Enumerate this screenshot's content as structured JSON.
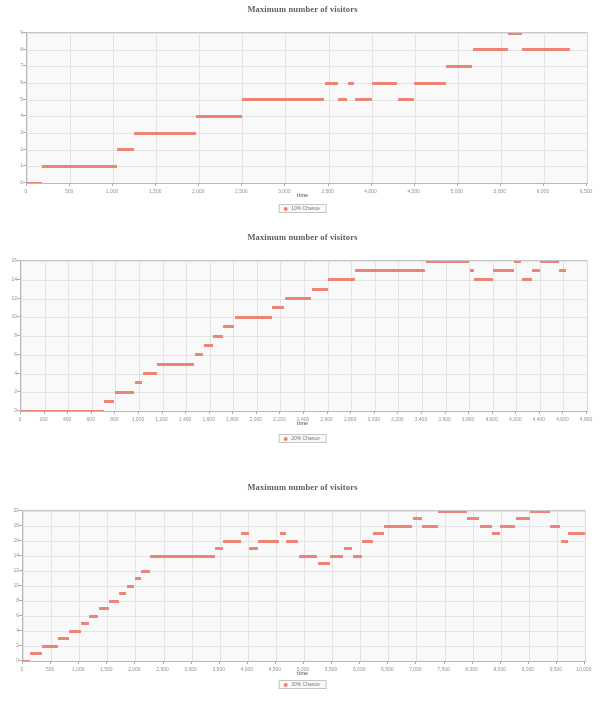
{
  "document": {
    "kind": "scanned-figure-page",
    "figure_count": 3
  },
  "accent_color": "#f0806e",
  "charts": [
    {
      "id": "chart-10-percent",
      "title": "Maximum number of visitors",
      "xlabel": "time",
      "ylabel": "",
      "legend": "10% Chance",
      "legend_position": "bottom-center"
    },
    {
      "id": "chart-20-percent",
      "title": "Maximum number of visitors",
      "xlabel": "time",
      "ylabel": "",
      "legend": "20% Chance",
      "legend_position": "bottom-center"
    },
    {
      "id": "chart-30-percent",
      "title": "Maximum number of visitors",
      "xlabel": "time",
      "ylabel": "",
      "legend": "30% Chance",
      "legend_position": "bottom-center"
    }
  ],
  "chart_data": [
    {
      "type": "scatter",
      "title": "Maximum number of visitors",
      "xlabel": "time",
      "ylabel": "",
      "legend": [
        "10% Chance"
      ],
      "legend_position": "bottom-center",
      "grid": true,
      "xlim": [
        0,
        6500
      ],
      "ylim": [
        0,
        9
      ],
      "xticks": [
        0,
        500,
        1000,
        1500,
        2000,
        2500,
        3000,
        3500,
        4000,
        4500,
        5000,
        5500,
        6000,
        6500
      ],
      "xtick_labels": [
        "0",
        "500",
        "1,000",
        "1,500",
        "2,000",
        "2,500",
        "3,000",
        "3,500",
        "4,000",
        "4,500",
        "5,000",
        "5,500",
        "6,000",
        "6,500"
      ],
      "yticks": [
        0,
        1,
        2,
        3,
        4,
        5,
        6,
        7,
        8,
        9
      ],
      "ytick_labels": [
        "0",
        "1",
        "2",
        "3",
        "4",
        "5",
        "6",
        "7",
        "8",
        "9"
      ],
      "series": [
        {
          "name": "10% Chance",
          "color": "#f0806e",
          "segments": [
            {
              "x0": 0,
              "x1": 170,
              "y": 0
            },
            {
              "x0": 175,
              "x1": 1040,
              "y": 1
            },
            {
              "x0": 1045,
              "x1": 1240,
              "y": 2
            },
            {
              "x0": 1245,
              "x1": 1960,
              "y": 3
            },
            {
              "x0": 1965,
              "x1": 2490,
              "y": 4
            },
            {
              "x0": 2495,
              "x1": 3450,
              "y": 5
            },
            {
              "x0": 3455,
              "x1": 3610,
              "y": 6
            },
            {
              "x0": 3615,
              "x1": 3720,
              "y": 5
            },
            {
              "x0": 3725,
              "x1": 3800,
              "y": 6
            },
            {
              "x0": 3805,
              "x1": 4000,
              "y": 5
            },
            {
              "x0": 4005,
              "x1": 4300,
              "y": 6
            },
            {
              "x0": 4305,
              "x1": 4490,
              "y": 5
            },
            {
              "x0": 4495,
              "x1": 4860,
              "y": 6
            },
            {
              "x0": 4865,
              "x1": 5170,
              "y": 7
            },
            {
              "x0": 5175,
              "x1": 5580,
              "y": 8
            },
            {
              "x0": 5585,
              "x1": 5740,
              "y": 9
            },
            {
              "x0": 5745,
              "x1": 6300,
              "y": 8
            }
          ]
        }
      ]
    },
    {
      "type": "scatter",
      "title": "Maximum number of visitors",
      "xlabel": "time",
      "ylabel": "",
      "legend": [
        "20% Chance"
      ],
      "legend_position": "bottom-center",
      "grid": true,
      "xlim": [
        0,
        4800
      ],
      "ylim": [
        0,
        16
      ],
      "xticks": [
        0,
        200,
        400,
        600,
        800,
        1000,
        1200,
        1400,
        1600,
        1800,
        2000,
        2200,
        2400,
        2600,
        2800,
        3000,
        3200,
        3400,
        3600,
        3800,
        4000,
        4200,
        4400,
        4600,
        4800
      ],
      "xtick_labels": [
        "0",
        "200",
        "400",
        "600",
        "800",
        "1,000",
        "1,200",
        "1,400",
        "1,600",
        "1,800",
        "2,000",
        "2,200",
        "2,400",
        "2,600",
        "2,800",
        "3,000",
        "3,200",
        "3,400",
        "3,600",
        "3,800",
        "4,000",
        "4,200",
        "4,400",
        "4,600",
        "4,800"
      ],
      "yticks": [
        0,
        2,
        4,
        6,
        8,
        10,
        12,
        14,
        16
      ],
      "ytick_labels": [
        "0",
        "2",
        "4",
        "6",
        "8",
        "10",
        "12",
        "14",
        "16"
      ],
      "series": [
        {
          "name": "20% Chance",
          "color": "#f0806e",
          "segments": [
            {
              "x0": 0,
              "x1": 700,
              "y": 0
            },
            {
              "x0": 705,
              "x1": 790,
              "y": 1
            },
            {
              "x0": 795,
              "x1": 960,
              "y": 2
            },
            {
              "x0": 965,
              "x1": 1030,
              "y": 3
            },
            {
              "x0": 1035,
              "x1": 1150,
              "y": 4
            },
            {
              "x0": 1155,
              "x1": 1470,
              "y": 5
            },
            {
              "x0": 1475,
              "x1": 1545,
              "y": 6
            },
            {
              "x0": 1550,
              "x1": 1625,
              "y": 7
            },
            {
              "x0": 1630,
              "x1": 1710,
              "y": 8
            },
            {
              "x0": 1715,
              "x1": 1810,
              "y": 9
            },
            {
              "x0": 1815,
              "x1": 2125,
              "y": 10
            },
            {
              "x0": 2130,
              "x1": 2230,
              "y": 11
            },
            {
              "x0": 2235,
              "x1": 2460,
              "y": 12
            },
            {
              "x0": 2465,
              "x1": 2600,
              "y": 13
            },
            {
              "x0": 2605,
              "x1": 2830,
              "y": 14
            },
            {
              "x0": 2835,
              "x1": 3430,
              "y": 15
            },
            {
              "x0": 3435,
              "x1": 3800,
              "y": 16
            },
            {
              "x0": 3805,
              "x1": 3840,
              "y": 15
            },
            {
              "x0": 3845,
              "x1": 4000,
              "y": 14
            },
            {
              "x0": 4005,
              "x1": 4180,
              "y": 15
            },
            {
              "x0": 4185,
              "x1": 4240,
              "y": 16
            },
            {
              "x0": 4245,
              "x1": 4330,
              "y": 14
            },
            {
              "x0": 4335,
              "x1": 4400,
              "y": 15
            },
            {
              "x0": 4405,
              "x1": 4560,
              "y": 16
            },
            {
              "x0": 4565,
              "x1": 4620,
              "y": 15
            }
          ]
        }
      ]
    },
    {
      "type": "scatter",
      "title": "Maximum number of visitors",
      "xlabel": "time",
      "ylabel": "",
      "legend": [
        "30% Chance"
      ],
      "legend_position": "bottom-center",
      "grid": true,
      "xlim": [
        0,
        10000
      ],
      "ylim": [
        0,
        20
      ],
      "xticks": [
        0,
        500,
        1000,
        1500,
        2000,
        2500,
        3000,
        3500,
        4000,
        4500,
        5000,
        5500,
        6000,
        6500,
        7000,
        7500,
        8000,
        8500,
        9000,
        9500,
        10000
      ],
      "xtick_labels": [
        "0",
        "500",
        "1,000",
        "1,500",
        "2,000",
        "2,500",
        "3,000",
        "3,500",
        "4,000",
        "4,500",
        "5,000",
        "5,500",
        "6,000",
        "6,500",
        "7,000",
        "7,500",
        "8,000",
        "8,500",
        "9,000",
        "9,500",
        "10,000"
      ],
      "yticks": [
        0,
        2,
        4,
        6,
        8,
        10,
        12,
        14,
        16,
        18,
        20
      ],
      "ytick_labels": [
        "0",
        "2",
        "4",
        "6",
        "8",
        "10",
        "12",
        "14",
        "16",
        "18",
        "20"
      ],
      "series": [
        {
          "name": "30% Chance",
          "color": "#f0806e",
          "segments": [
            {
              "x0": 0,
              "x1": 120,
              "y": 0
            },
            {
              "x0": 125,
              "x1": 330,
              "y": 1
            },
            {
              "x0": 335,
              "x1": 620,
              "y": 2
            },
            {
              "x0": 625,
              "x1": 810,
              "y": 3
            },
            {
              "x0": 815,
              "x1": 1030,
              "y": 4
            },
            {
              "x0": 1035,
              "x1": 1170,
              "y": 5
            },
            {
              "x0": 1175,
              "x1": 1340,
              "y": 6
            },
            {
              "x0": 1345,
              "x1": 1530,
              "y": 7
            },
            {
              "x0": 1535,
              "x1": 1700,
              "y": 8
            },
            {
              "x0": 1705,
              "x1": 1840,
              "y": 9
            },
            {
              "x0": 1845,
              "x1": 1980,
              "y": 10
            },
            {
              "x0": 1985,
              "x1": 2100,
              "y": 11
            },
            {
              "x0": 2105,
              "x1": 2260,
              "y": 12
            },
            {
              "x0": 2265,
              "x1": 3420,
              "y": 14
            },
            {
              "x0": 3425,
              "x1": 3560,
              "y": 15
            },
            {
              "x0": 3565,
              "x1": 3880,
              "y": 16
            },
            {
              "x0": 3885,
              "x1": 4020,
              "y": 17
            },
            {
              "x0": 4025,
              "x1": 4180,
              "y": 15
            },
            {
              "x0": 4185,
              "x1": 4560,
              "y": 16
            },
            {
              "x0": 4565,
              "x1": 4680,
              "y": 17
            },
            {
              "x0": 4685,
              "x1": 4900,
              "y": 16
            },
            {
              "x0": 4905,
              "x1": 5240,
              "y": 14
            },
            {
              "x0": 5245,
              "x1": 5460,
              "y": 13
            },
            {
              "x0": 5465,
              "x1": 5700,
              "y": 14
            },
            {
              "x0": 5705,
              "x1": 5860,
              "y": 15
            },
            {
              "x0": 5865,
              "x1": 6030,
              "y": 14
            },
            {
              "x0": 6035,
              "x1": 6230,
              "y": 16
            },
            {
              "x0": 6235,
              "x1": 6420,
              "y": 17
            },
            {
              "x0": 6425,
              "x1": 6930,
              "y": 18
            },
            {
              "x0": 6935,
              "x1": 7100,
              "y": 19
            },
            {
              "x0": 7105,
              "x1": 7380,
              "y": 18
            },
            {
              "x0": 7385,
              "x1": 7900,
              "y": 20
            },
            {
              "x0": 7905,
              "x1": 8120,
              "y": 19
            },
            {
              "x0": 8125,
              "x1": 8340,
              "y": 18
            },
            {
              "x0": 8345,
              "x1": 8480,
              "y": 17
            },
            {
              "x0": 8485,
              "x1": 8760,
              "y": 18
            },
            {
              "x0": 8765,
              "x1": 9020,
              "y": 19
            },
            {
              "x0": 9025,
              "x1": 9380,
              "y": 20
            },
            {
              "x0": 9385,
              "x1": 9560,
              "y": 18
            },
            {
              "x0": 9565,
              "x1": 9700,
              "y": 16
            },
            {
              "x0": 9705,
              "x1": 10000,
              "y": 17
            }
          ]
        }
      ]
    }
  ]
}
